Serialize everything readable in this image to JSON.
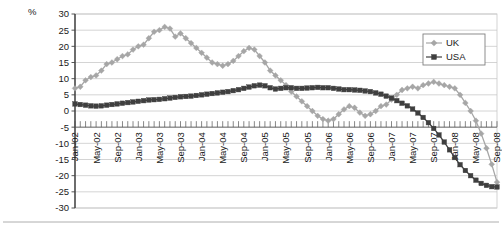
{
  "chart_data": {
    "type": "line",
    "title": "",
    "subtitle": "",
    "xlabel": "",
    "ylabel": "",
    "unit_label": "%",
    "grid": true,
    "legend_position": "top-right",
    "ylim": [
      -30,
      30
    ],
    "ytick_step": 5,
    "yticks": [
      "30",
      "25",
      "20",
      "15",
      "10",
      "5",
      "0",
      "-5",
      "-10",
      "-15",
      "-20",
      "-25",
      "-30"
    ],
    "x_tick_label_interval": 4,
    "x": [
      "Jan-02",
      "Feb-02",
      "Mar-02",
      "Apr-02",
      "May-02",
      "Jun-02",
      "Jul-02",
      "Aug-02",
      "Sep-02",
      "Oct-02",
      "Nov-02",
      "Dec-02",
      "Jan-03",
      "Feb-03",
      "Mar-03",
      "Apr-03",
      "May-03",
      "Jun-03",
      "Jul-03",
      "Aug-03",
      "Sep-03",
      "Oct-03",
      "Nov-03",
      "Dec-03",
      "Jan-04",
      "Feb-04",
      "Mar-04",
      "Apr-04",
      "May-04",
      "Jun-04",
      "Jul-04",
      "Aug-04",
      "Sep-04",
      "Oct-04",
      "Nov-04",
      "Dec-04",
      "Jan-05",
      "Feb-05",
      "Mar-05",
      "Apr-05",
      "May-05",
      "Jun-05",
      "Jul-05",
      "Aug-05",
      "Sep-05",
      "Oct-05",
      "Nov-05",
      "Dec-05",
      "Jan-06",
      "Feb-06",
      "Mar-06",
      "Apr-06",
      "May-06",
      "Jun-06",
      "Jul-06",
      "Aug-06",
      "Sep-06",
      "Oct-06",
      "Nov-06",
      "Dec-06",
      "Jan-07",
      "Feb-07",
      "Mar-07",
      "Apr-07",
      "May-07",
      "Jun-07",
      "Jul-07",
      "Aug-07",
      "Sep-07",
      "Oct-07",
      "Nov-07",
      "Dec-07",
      "Jan-08",
      "Feb-08",
      "Mar-08",
      "Apr-08",
      "May-08",
      "Jun-08",
      "Jul-08",
      "Aug-08",
      "Sep-08"
    ],
    "xticklabels": [
      "Jan-02",
      "May-02",
      "Sep-02",
      "Jan-03",
      "May-03",
      "Sep-03",
      "Jan-04",
      "May-04",
      "Sep-04",
      "Jan-05",
      "May-05",
      "Sep-05",
      "Jan-06",
      "May-06",
      "Sep-06",
      "Jan-07",
      "May-07",
      "Sep-07",
      "Jan-08",
      "May-08",
      "Sep-08"
    ],
    "series": [
      {
        "name": "UK",
        "color": "#a6a6a6",
        "marker": "diamond",
        "values": [
          7.0,
          7.5,
          9.5,
          10.5,
          11.0,
          12.5,
          14.5,
          15.0,
          16.0,
          17.0,
          17.5,
          19.0,
          20.0,
          20.5,
          22.5,
          24.5,
          25.0,
          26.0,
          25.5,
          23.0,
          24.0,
          22.5,
          21.0,
          19.5,
          18.0,
          16.5,
          15.0,
          14.5,
          14.0,
          14.5,
          15.5,
          17.0,
          18.5,
          19.5,
          19.0,
          17.0,
          15.0,
          12.5,
          11.0,
          9.5,
          8.0,
          6.0,
          4.5,
          3.0,
          1.5,
          0.0,
          -1.5,
          -2.5,
          -3.0,
          -2.5,
          -1.0,
          0.5,
          1.5,
          1.0,
          -0.5,
          -1.5,
          -1.0,
          0.0,
          1.5,
          2.0,
          3.5,
          5.0,
          6.5,
          7.0,
          7.5,
          7.0,
          8.0,
          8.5,
          9.0,
          8.5,
          8.0,
          7.5,
          7.0,
          5.0,
          2.5,
          0.0,
          -3.0,
          -7.0,
          -11.5,
          -16.5,
          -22.0
        ]
      },
      {
        "name": "USA",
        "color": "#3f3f3f",
        "marker": "square",
        "values": [
          2.2,
          2.0,
          1.8,
          1.6,
          1.5,
          1.6,
          1.8,
          2.0,
          2.2,
          2.4,
          2.6,
          2.8,
          3.0,
          3.2,
          3.4,
          3.5,
          3.6,
          3.8,
          4.0,
          4.2,
          4.4,
          4.5,
          4.6,
          4.8,
          5.0,
          5.2,
          5.4,
          5.6,
          5.8,
          6.0,
          6.3,
          6.6,
          7.0,
          7.4,
          7.8,
          8.0,
          7.8,
          7.2,
          6.8,
          7.0,
          7.2,
          7.2,
          7.0,
          7.0,
          7.1,
          7.2,
          7.3,
          7.2,
          7.2,
          7.0,
          6.8,
          6.6,
          6.6,
          6.5,
          6.4,
          6.2,
          6.0,
          5.6,
          5.2,
          4.6,
          4.0,
          3.2,
          2.4,
          1.6,
          0.6,
          -0.6,
          -2.0,
          -3.6,
          -5.4,
          -7.4,
          -9.6,
          -12.0,
          -14.4,
          -16.6,
          -18.4,
          -20.0,
          -21.4,
          -22.4,
          -23.0,
          -23.4,
          -23.5
        ]
      }
    ]
  },
  "legend": {
    "items": [
      {
        "label": "UK",
        "color": "#a6a6a6",
        "marker": "diamond"
      },
      {
        "label": "USA",
        "color": "#3f3f3f",
        "marker": "square"
      }
    ]
  }
}
